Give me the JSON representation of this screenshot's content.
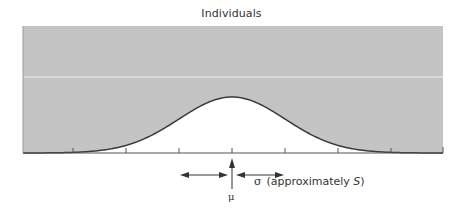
{
  "title": "Individuals",
  "colors": {
    "background_band": "#c4c4c4",
    "curve_fill": "#ffffff",
    "curve_stroke": "#3a3a3a",
    "axis": "#555555",
    "separator_line": "#eeeeee",
    "text": "#333333"
  },
  "labels": {
    "mu_symbol": "μ",
    "sigma_symbol": "σ",
    "sigma_note_prefix": "(approximately ",
    "sigma_note_var": "S",
    "sigma_note_suffix": ")"
  },
  "chart_data": {
    "type": "area",
    "title": "Individuals",
    "xlabel": "",
    "ylabel": "",
    "mean_label": "μ",
    "sd_label": "σ (approximately S)",
    "x_ticks_in_sigma": [
      -3,
      -2,
      -1,
      0,
      1,
      2,
      3
    ],
    "x_tick_labels": [],
    "grid": false,
    "legend": null,
    "annotations": [
      {
        "text": "μ",
        "at_sigma": 0,
        "kind": "up-arrow to mean"
      },
      {
        "text": "σ (approximately S)",
        "kind": "double arrows spanning ±1σ from mean"
      }
    ],
    "curve": {
      "distribution": "normal",
      "mean": 0,
      "sd": 1,
      "x_range_sigma": [
        -4,
        4
      ]
    }
  }
}
